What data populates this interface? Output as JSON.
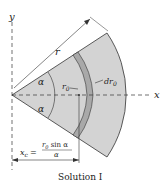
{
  "diagram": {
    "labels": {
      "y_axis": "y",
      "x_axis": "x",
      "radius": "r",
      "alpha_upper": "α",
      "alpha_lower": "α",
      "r0": "r",
      "r0_sub": "0",
      "dr0": "dr",
      "dr0_sub": "0",
      "xc_lhs": "x",
      "xc_lhs_sub": "c",
      "xc_eq": "=",
      "xc_num": "r",
      "xc_num_sub": "0",
      "xc_num_rest": " sin α",
      "xc_den": "α"
    },
    "caption": "Solution I",
    "colors": {
      "sector_fill": "#d3d3d3",
      "band_fill": "#a9a9a9",
      "line": "#333333"
    }
  }
}
